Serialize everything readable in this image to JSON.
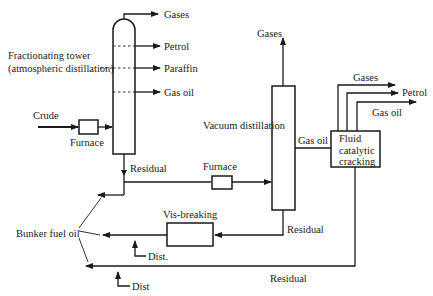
{
  "diagram": {
    "fractionating_tower": {
      "label_line1": "Fractionating tower",
      "label_line2": "(atmospheric distillation)",
      "outputs": [
        "Gases",
        "Petrol",
        "Paraffin",
        "Gas oil"
      ]
    },
    "crude_input": "Crude",
    "furnace_1": "Furnace",
    "furnace_2": "Furnace",
    "residual_1": "Residual",
    "vacuum_distillation": {
      "label": "Vacuum distillation",
      "top_output": "Gases",
      "side_output": "Gas oil",
      "bottom_output": "Residual"
    },
    "fcc": {
      "label_line1": "Fluid",
      "label_line2": "catalytic",
      "label_line3": "cracking",
      "outputs": [
        "Gases",
        "Petrol",
        "Gas oil"
      ],
      "bottom_output": "Residual"
    },
    "vis_breaking": "Vis-breaking",
    "bunker_fuel_oil": "Bunker fuel oil",
    "dist_1": "Dist.",
    "dist_2": "Dist"
  }
}
